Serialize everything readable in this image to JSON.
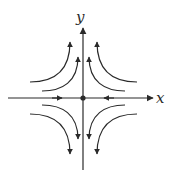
{
  "diagram": {
    "type": "phase-portrait",
    "axes": {
      "x_label": "x",
      "y_label": "y"
    },
    "colors": {
      "stroke": "#2a2a2a",
      "background": "#ffffff"
    },
    "origin": {
      "label": "",
      "marker": "dot"
    },
    "x_axis_flow": [
      "toward-origin-from-left",
      "toward-origin-from-right"
    ],
    "y_axis_flow": [
      "away-from-origin-up",
      "away-from-origin-down"
    ],
    "trajectories": [
      {
        "quadrant": "upper-left",
        "ring": "outer",
        "direction": "up"
      },
      {
        "quadrant": "upper-left",
        "ring": "inner",
        "direction": "up"
      },
      {
        "quadrant": "upper-right",
        "ring": "outer",
        "direction": "up"
      },
      {
        "quadrant": "upper-right",
        "ring": "inner",
        "direction": "up"
      },
      {
        "quadrant": "lower-left",
        "ring": "outer",
        "direction": "down"
      },
      {
        "quadrant": "lower-left",
        "ring": "inner",
        "direction": "down"
      },
      {
        "quadrant": "lower-right",
        "ring": "outer",
        "direction": "down"
      },
      {
        "quadrant": "lower-right",
        "ring": "inner",
        "direction": "down"
      }
    ]
  }
}
